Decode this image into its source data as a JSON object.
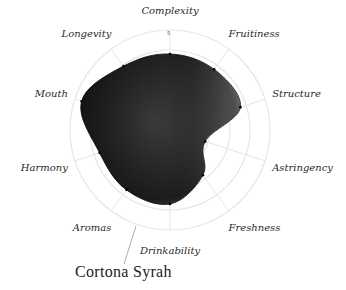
{
  "chart_data": {
    "type": "radar",
    "title": "Cortona Syrah",
    "axes": [
      "Complexity",
      "Fruitiness",
      "Structure",
      "Astringency",
      "Freshness",
      "Drinkability",
      "Aromas",
      "Harmony",
      "Mouth",
      "Longevity"
    ],
    "series": [
      {
        "name": "Cortona Syrah",
        "values": [
          3.8,
          3.75,
          3.7,
          1.85,
          2.8,
          3.7,
          3.7,
          3.7,
          4.65,
          3.95
        ]
      }
    ],
    "rmax": 5,
    "rings": [
      1,
      2,
      3,
      4,
      5
    ],
    "tick_label": "5",
    "grid": true,
    "fill": "textured dark ink wash (black/grey)",
    "grid_color": "#e6e6e6"
  },
  "title": "Cortona Syrah",
  "colors": {
    "fill_dark": "#1a1a1a",
    "fill_mid": "#3a3a3a",
    "grid": "#e6e6e6",
    "label": "#2a2a2a"
  }
}
